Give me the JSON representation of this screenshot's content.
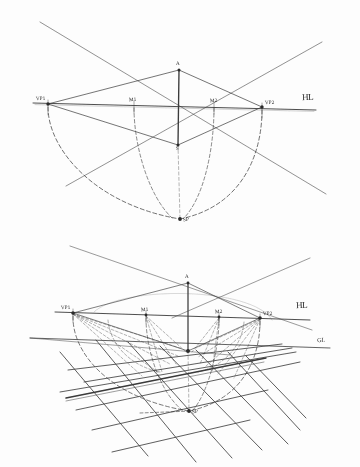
{
  "document": {
    "title": "Two-point perspective construction (hand sketch)",
    "background_color": "#fdfdfd",
    "ink_color": "#2b2b2b",
    "sheet_width": 360,
    "sheet_height": 467
  },
  "figures": [
    {
      "id": "figure-top",
      "name": "measuring-point-construction",
      "labels": {
        "vp_left": "VP1",
        "vp_right": "VP2",
        "measure_left": "M1",
        "measure_right": "M2",
        "apex": "A",
        "station": "S",
        "horizon": "HL",
        "station_point": "SP"
      },
      "points": {
        "vp_left": {
          "x": 48,
          "y": 104
        },
        "vp_right": {
          "x": 262,
          "y": 107
        },
        "measure_left": {
          "x": 134,
          "y": 105
        },
        "measure_right": {
          "x": 214,
          "y": 106
        },
        "apex": {
          "x": 179,
          "y": 70
        },
        "station": {
          "x": 178,
          "y": 145
        },
        "station_point": {
          "x": 180,
          "y": 219
        }
      },
      "horizon_line": {
        "x1": 33,
        "y1": 103,
        "x2": 316,
        "y2": 110
      },
      "arcs": [
        {
          "name": "arc-vp-left",
          "from": "vp_left",
          "to": "station_point"
        },
        {
          "name": "arc-vp-right",
          "from": "vp_right",
          "to": "station_point"
        },
        {
          "name": "arc-m-left",
          "from": "measure_left",
          "to": "station_point"
        },
        {
          "name": "arc-m-right",
          "from": "measure_right",
          "to": "station_point"
        }
      ]
    },
    {
      "id": "figure-bottom",
      "name": "perspective-grid-construction",
      "labels": {
        "vp_left": "VP1",
        "vp_right": "VP2",
        "measure_left": "M1",
        "measure_right": "M2",
        "apex": "A",
        "horizon": "HL",
        "ground": "GL",
        "station_point": "SP"
      },
      "points": {
        "vp_left": {
          "x": 73,
          "y": 313
        },
        "vp_right": {
          "x": 260,
          "y": 318
        },
        "measure_left": {
          "x": 146,
          "y": 315
        },
        "measure_right": {
          "x": 219,
          "y": 317
        },
        "apex": {
          "x": 188,
          "y": 283
        },
        "center": {
          "x": 188,
          "y": 351
        },
        "station_point": {
          "x": 189,
          "y": 411
        }
      },
      "horizon_line": {
        "x1": 55,
        "y1": 312,
        "x2": 310,
        "y2": 320
      },
      "ground_line": {
        "x1": 30,
        "y1": 338,
        "x2": 330,
        "y2": 348
      },
      "grid": {
        "rays_to_left_vp": 7,
        "rays_to_right_vp": 7,
        "description": "two converging families of straight lines forming a receding floor grid"
      }
    }
  ]
}
